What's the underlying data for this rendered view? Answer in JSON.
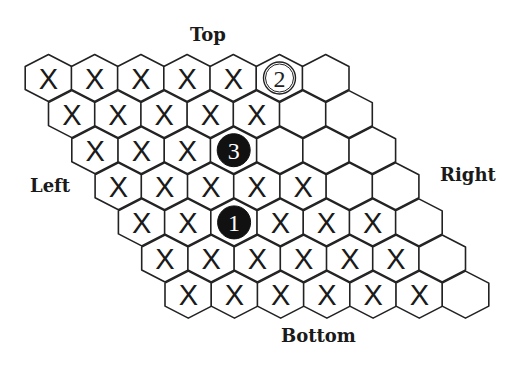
{
  "labels": {
    "top": "Top",
    "left": "Left",
    "right": "Right",
    "bottom": "Bottom"
  },
  "board": {
    "rows": 7,
    "cols": 7,
    "origin": {
      "x": 48.5,
      "y": 78
    },
    "col_step": 46.2,
    "row_step_x": 23.3,
    "row_step_y": 36.1,
    "hex_half_width": 23.3,
    "hex_half_height": 23.5,
    "hex_side_half": 11.5,
    "cells": [
      [
        "X",
        "X",
        "X",
        "X",
        "X",
        "2",
        ""
      ],
      [
        "X",
        "X",
        "X",
        "X",
        "X",
        "",
        ""
      ],
      [
        "X",
        "X",
        "X",
        "3",
        "",
        "",
        ""
      ],
      [
        "X",
        "X",
        "X",
        "X",
        "X",
        "",
        ""
      ],
      [
        "X",
        "X",
        "1",
        "X",
        "X",
        "X",
        ""
      ],
      [
        "X",
        "X",
        "X",
        "X",
        "X",
        "X",
        ""
      ],
      [
        "X",
        "X",
        "X",
        "X",
        "X",
        "X",
        ""
      ]
    ],
    "stones": [
      {
        "label": "1",
        "row": 5,
        "col": 3,
        "color": "black"
      },
      {
        "label": "2",
        "row": 1,
        "col": 6,
        "color": "white"
      },
      {
        "label": "3",
        "row": 3,
        "col": 4,
        "color": "black"
      }
    ],
    "mark_symbol": "X"
  },
  "colors": {
    "stroke": "#222222",
    "black_stone": "#111111",
    "white_stone": "#ffffff",
    "background": "#ffffff"
  }
}
